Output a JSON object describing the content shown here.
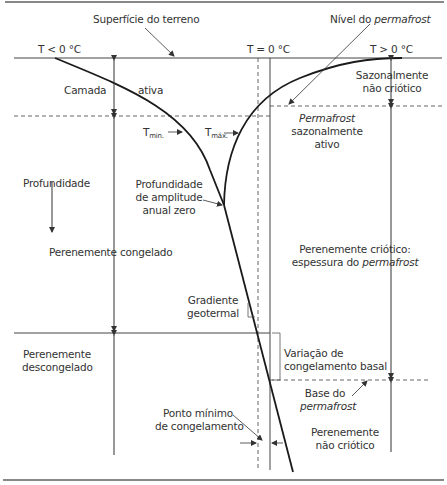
{
  "diagram": {
    "labels": {
      "surface": "Superfície do terreno",
      "permafrost_table_prefix": "Nível do ",
      "permafrost_table_italic": "permafrost",
      "t_below": "T < 0 °C",
      "t_zero": "T = 0 °C",
      "t_above": "T > 0 °C",
      "active_layer_left": "Camada",
      "active_layer_right": "ativa",
      "seasonal_noncryotic_1": "Sazonalmente",
      "seasonal_noncryotic_2": "não criótico",
      "seasonal_active_1": "Permafrost",
      "seasonal_active_2": "sazonalmente",
      "seasonal_active_3": "ativo",
      "tmin": "T",
      "tmin_sub": "min.",
      "tmax": "T",
      "tmax_sub": "máx.",
      "depth": "Profundidade",
      "zero_amplitude_1": "Profundidade",
      "zero_amplitude_2": "de amplitude",
      "zero_amplitude_3": "anual zero",
      "perennially_frozen": "Perenemente congelado",
      "perennially_cryotic_1": "Perenemente criótico:",
      "perennially_cryotic_2_prefix": "espessura do ",
      "perennially_cryotic_2_italic": "permafrost",
      "geothermal_1": "Gradiente",
      "geothermal_2": "geotermal",
      "unfrozen_1": "Perenemente",
      "unfrozen_2": "descongelado",
      "basal_1": "Variação de",
      "basal_2": "congelamento basal",
      "base_1": "Base do",
      "base_2": "permafrost",
      "min_freeze_1": "Ponto mínimo",
      "min_freeze_2": "de congelamento",
      "noncryotic_1": "Perenemente",
      "noncryotic_2": "não criótico"
    },
    "colors": {
      "line": "#1a1a1a",
      "thin": "#555555",
      "border": "#888888"
    }
  }
}
